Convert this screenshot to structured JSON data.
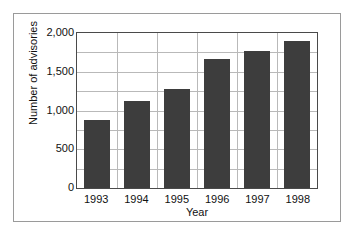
{
  "chart_data": {
    "type": "bar",
    "title": "",
    "xlabel": "Year",
    "ylabel": "Number of advisories",
    "categories": [
      "1993",
      "1994",
      "1995",
      "1996",
      "1997",
      "1998"
    ],
    "values": [
      875,
      1125,
      1275,
      1665,
      1765,
      1900
    ],
    "ylim": [
      0,
      2000
    ],
    "ytick_labels": [
      "0",
      "500",
      "1,000",
      "1,500",
      "2,000"
    ],
    "ytick_values": [
      0,
      500,
      1000,
      1500,
      2000
    ],
    "gridline_values": [
      250,
      500,
      750,
      1000,
      1250,
      1500,
      1750
    ],
    "grid": true,
    "legend": "none",
    "bar_color": "#3d3d3d",
    "grid_color": "#b9b9b9",
    "axis_color": "#4a4a4a",
    "background_color": "#ffffff"
  }
}
